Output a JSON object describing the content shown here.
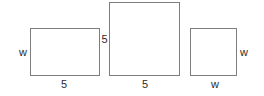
{
  "figure": {
    "type": "geometry-diagram",
    "background_color": "#ffffff",
    "stroke_color": "#7d7d7d",
    "label_color": "#2b2b2b",
    "width": 264,
    "height": 96,
    "shapes": [
      {
        "id": "rectangle-1",
        "name": "left-rectangle",
        "x": 30,
        "y": 28,
        "width": 70,
        "height": 48,
        "labels": [
          {
            "id": "label-left-rect-height",
            "text": "w",
            "position": "left",
            "x": 18,
            "y": 47
          },
          {
            "id": "label-left-rect-width",
            "text": "5",
            "position": "bottom",
            "x": 58,
            "y": 79
          }
        ]
      },
      {
        "id": "rectangle-2",
        "name": "middle-rectangle",
        "x": 109,
        "y": 2,
        "width": 71,
        "height": 74,
        "labels": [
          {
            "id": "label-middle-rect-height",
            "text": "5",
            "position": "left",
            "x": 100,
            "y": 34
          },
          {
            "id": "label-middle-rect-width",
            "text": "5",
            "position": "bottom",
            "x": 139,
            "y": 79
          }
        ]
      },
      {
        "id": "rectangle-3",
        "name": "right-rectangle",
        "x": 190,
        "y": 28,
        "width": 47,
        "height": 48,
        "labels": [
          {
            "id": "label-right-rect-height",
            "text": "w",
            "position": "right",
            "x": 239,
            "y": 47
          },
          {
            "id": "label-right-rect-width",
            "text": "w",
            "position": "bottom",
            "x": 209,
            "y": 79
          }
        ]
      }
    ]
  }
}
